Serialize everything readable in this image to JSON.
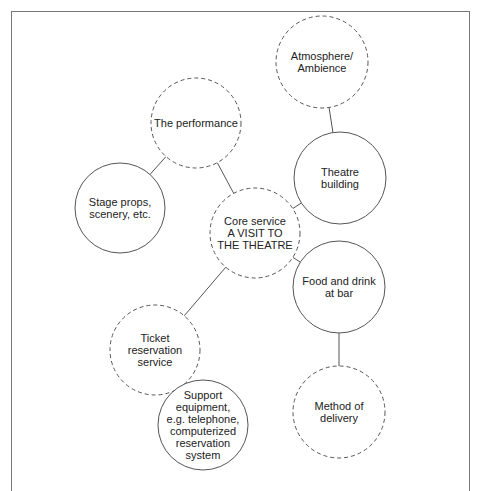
{
  "diagram": {
    "title": "",
    "nodes": [
      {
        "id": "atmosphere",
        "label": "Atmosphere/\nAmbience",
        "style": "dashed",
        "cx": 322,
        "cy": 62,
        "r": 46
      },
      {
        "id": "performance",
        "label": "The performance",
        "style": "dashed",
        "cx": 196,
        "cy": 123,
        "r": 45
      },
      {
        "id": "stage_props",
        "label": "Stage props,\nscenery, etc.",
        "style": "solid",
        "cx": 120,
        "cy": 208,
        "r": 45
      },
      {
        "id": "core",
        "label": "Core service\nA VISIT TO\nTHE THEATRE",
        "style": "dashed",
        "cx": 255,
        "cy": 233,
        "r": 45
      },
      {
        "id": "theatre_building",
        "label": "Theatre\nbuilding",
        "style": "solid",
        "cx": 340,
        "cy": 178,
        "r": 46
      },
      {
        "id": "ticket",
        "label": "Ticket\nreservation\nservice",
        "style": "dashed",
        "cx": 155,
        "cy": 350,
        "r": 45
      },
      {
        "id": "food",
        "label": "Food and drink\nat bar",
        "style": "solid",
        "cx": 339,
        "cy": 287,
        "r": 46
      },
      {
        "id": "support",
        "label": "Support\nequipment,\ne.g. telephone,\ncomputerized\nreservation\nsystem",
        "style": "solid",
        "cx": 203,
        "cy": 425,
        "r": 45
      },
      {
        "id": "method",
        "label": "Method of\ndelivery",
        "style": "dashed",
        "cx": 339,
        "cy": 412,
        "r": 46
      }
    ],
    "edges": [
      {
        "from": "atmosphere",
        "to": "theatre_building"
      },
      {
        "from": "performance",
        "to": "stage_props"
      },
      {
        "from": "performance",
        "to": "core"
      },
      {
        "from": "core",
        "to": "theatre_building"
      },
      {
        "from": "core",
        "to": "ticket"
      },
      {
        "from": "core",
        "to": "food"
      },
      {
        "from": "ticket",
        "to": "support"
      },
      {
        "from": "food",
        "to": "method"
      }
    ],
    "colors": {
      "stroke": "#555555",
      "text": "#222222",
      "frame": "#777777"
    }
  }
}
